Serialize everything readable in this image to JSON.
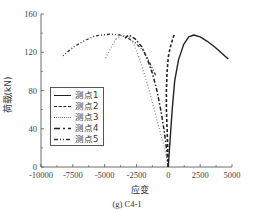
{
  "chart_data": {
    "type": "line",
    "title": "",
    "caption": "(g) C4-1",
    "xlabel": "应变",
    "ylabel": "荷载(kN)",
    "xlim": [
      -10000,
      5000
    ],
    "ylim": [
      0,
      160
    ],
    "xticks": [
      -10000,
      -7500,
      -5000,
      -2500,
      0,
      2500,
      5000
    ],
    "yticks": [
      0,
      40,
      80,
      120,
      160
    ],
    "grid": false,
    "legend_position": "left-middle",
    "series": [
      {
        "name": "测点1",
        "style": "solid",
        "x": [
          0,
          150,
          300,
          500,
          800,
          1200,
          1600,
          2000,
          2500,
          3000,
          3600,
          4200,
          4700
        ],
        "y": [
          0,
          30,
          60,
          90,
          112,
          128,
          136,
          138,
          136,
          132,
          126,
          119,
          113
        ]
      },
      {
        "name": "测点2",
        "style": "dashed",
        "x": [
          0,
          -50,
          -100,
          -150,
          -150,
          -100,
          0,
          150,
          350,
          450
        ],
        "y": [
          0,
          20,
          40,
          60,
          80,
          100,
          115,
          125,
          134,
          138
        ]
      },
      {
        "name": "测点3",
        "style": "dotted",
        "x": [
          0,
          -300,
          -700,
          -1100,
          -1500,
          -1900,
          -2300,
          -2700,
          -3100,
          -3600,
          -4100
        ],
        "y": [
          0,
          20,
          40,
          60,
          80,
          98,
          115,
          128,
          136,
          138,
          134
        ]
      },
      {
        "name": "测点4",
        "style": "dash-long",
        "x": [
          0,
          -150,
          -350,
          -600,
          -900,
          -1250,
          -1650,
          -2100,
          -2600,
          -3100,
          -3500
        ],
        "y": [
          0,
          20,
          40,
          60,
          80,
          98,
          113,
          126,
          134,
          138,
          134
        ]
      },
      {
        "name": "测点5",
        "style": "dash-dot",
        "x": [
          -1000,
          -1500,
          -2000,
          -2600,
          -3200,
          -3800,
          -4500,
          -5200,
          -5800,
          -6600,
          -7400,
          -8300
        ],
        "y": [
          96,
          110,
          122,
          130,
          135,
          138,
          139,
          138,
          137,
          132,
          126,
          116
        ]
      },
      {
        "name": "测点3-branch",
        "style": "dotted",
        "x": [
          -4100,
          -4500,
          -5000
        ],
        "y": [
          134,
          125,
          112
        ]
      }
    ]
  },
  "legend": {
    "items": [
      {
        "label": "测点1"
      },
      {
        "label": "测点2"
      },
      {
        "label": "测点3"
      },
      {
        "label": "测点4"
      },
      {
        "label": "测点5"
      }
    ]
  }
}
